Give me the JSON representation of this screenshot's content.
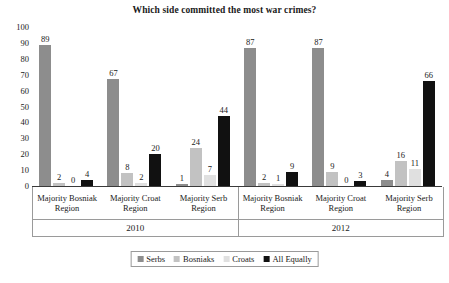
{
  "chart_data": {
    "type": "bar",
    "title": "Which side committed the most war crimes?",
    "xlabel": "",
    "ylabel": "",
    "ylim": [
      0,
      100
    ],
    "ytick_step": 10,
    "yticks": [
      "100",
      "90",
      "80",
      "70",
      "60",
      "50",
      "40",
      "30",
      "20",
      "10",
      "0"
    ],
    "grid": false,
    "legend_position": "bottom-center",
    "categories": [
      "Majority Bosniak Region",
      "Majority Croat Region",
      "Majority Serb Region",
      "Majority Bosniak Region",
      "Majority Croat Region",
      "Majority Serb Region"
    ],
    "group_labels": [
      "2010",
      "2012"
    ],
    "groups_per_label": 3,
    "series": [
      {
        "name": "Serbs",
        "color": "#8d8d8d",
        "values": [
          89,
          67,
          1,
          87,
          87,
          4
        ]
      },
      {
        "name": "Bosniaks",
        "color": "#c2c2c2",
        "values": [
          2,
          8,
          24,
          2,
          9,
          16
        ]
      },
      {
        "name": "Croats",
        "color": "#e0e0e0",
        "values": [
          0,
          2,
          7,
          1,
          0,
          11
        ]
      },
      {
        "name": "All Equally",
        "color": "#111111",
        "values": [
          4,
          20,
          44,
          9,
          3,
          66
        ]
      }
    ]
  },
  "caption": ""
}
